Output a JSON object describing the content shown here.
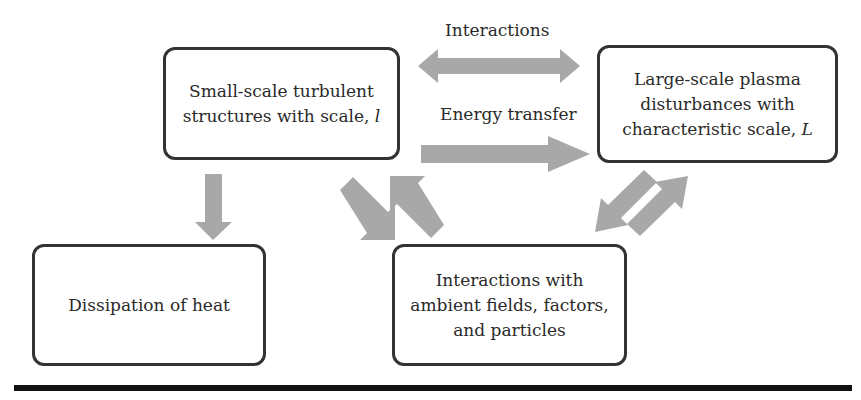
{
  "diagram": {
    "nodes": {
      "small_scale": {
        "line1": "Small-scale turbulent",
        "line2": "structures with scale,",
        "symbol": "l"
      },
      "large_scale": {
        "line1": "Large-scale plasma",
        "line2": "disturbances with",
        "line3": "characteristic scale,",
        "symbol": "L"
      },
      "dissipation": {
        "line1": "Dissipation of heat"
      },
      "interactions_ambient": {
        "line1": "Interactions with",
        "line2": "ambient fields, factors,",
        "line3": "and particles"
      }
    },
    "edge_labels": {
      "interactions": "Interactions",
      "energy_transfer": "Energy transfer"
    },
    "edges": [
      {
        "from": "small_scale",
        "to": "large_scale",
        "type": "bidirectional",
        "label": "Interactions"
      },
      {
        "from": "small_scale",
        "to": "large_scale",
        "type": "directed",
        "label": "Energy transfer"
      },
      {
        "from": "small_scale",
        "to": "dissipation",
        "type": "directed"
      },
      {
        "from": "small_scale",
        "to": "interactions_ambient",
        "type": "directed"
      },
      {
        "from": "interactions_ambient",
        "to": "small_scale",
        "type": "directed"
      },
      {
        "from": "large_scale",
        "to": "interactions_ambient",
        "type": "directed"
      },
      {
        "from": "interactions_ambient",
        "to": "large_scale",
        "type": "directed"
      }
    ],
    "colors": {
      "arrow": "#a8a8a8",
      "border": "#333333",
      "rule": "#111111"
    }
  }
}
